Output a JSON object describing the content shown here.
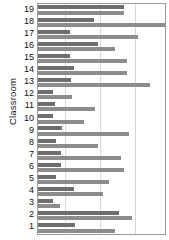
{
  "chart_data": {
    "type": "bar",
    "orientation": "horizontal",
    "title": "",
    "xlabel": "",
    "ylabel": "Classroom",
    "grid": true,
    "legend": "none",
    "xlim": [
      0,
      100
    ],
    "ylim_categories": 19,
    "categories": [
      "1",
      "2",
      "3",
      "4",
      "5",
      "6",
      "7",
      "8",
      "9",
      "10",
      "11",
      "12",
      "13",
      "14",
      "15",
      "16",
      "17",
      "18",
      "19"
    ],
    "tick_labels": [
      "19",
      "18",
      "17",
      "16",
      "15",
      "14",
      "13",
      "12",
      "11",
      "10",
      "9",
      "8",
      "7",
      "6",
      "5",
      "4",
      "3",
      "2",
      "1"
    ],
    "xticks": [
      0,
      21,
      49,
      76
    ],
    "colors": {
      "series1": "#6e6e6e",
      "series2": "#8c8c8c"
    },
    "series": [
      {
        "name": "Series 1",
        "color": "#6e6e6e",
        "values": [
          29,
          64,
          12,
          28,
          14,
          18,
          18,
          14,
          19,
          12,
          13,
          12,
          26,
          28,
          25,
          47,
          25,
          44,
          68
        ]
      },
      {
        "name": "Series 2",
        "color": "#8c8c8c",
        "values": [
          61,
          74,
          17,
          51,
          56,
          68,
          65,
          47,
          72,
          36,
          45,
          27,
          88,
          70,
          70,
          61,
          79,
          100,
          68
        ]
      }
    ]
  }
}
